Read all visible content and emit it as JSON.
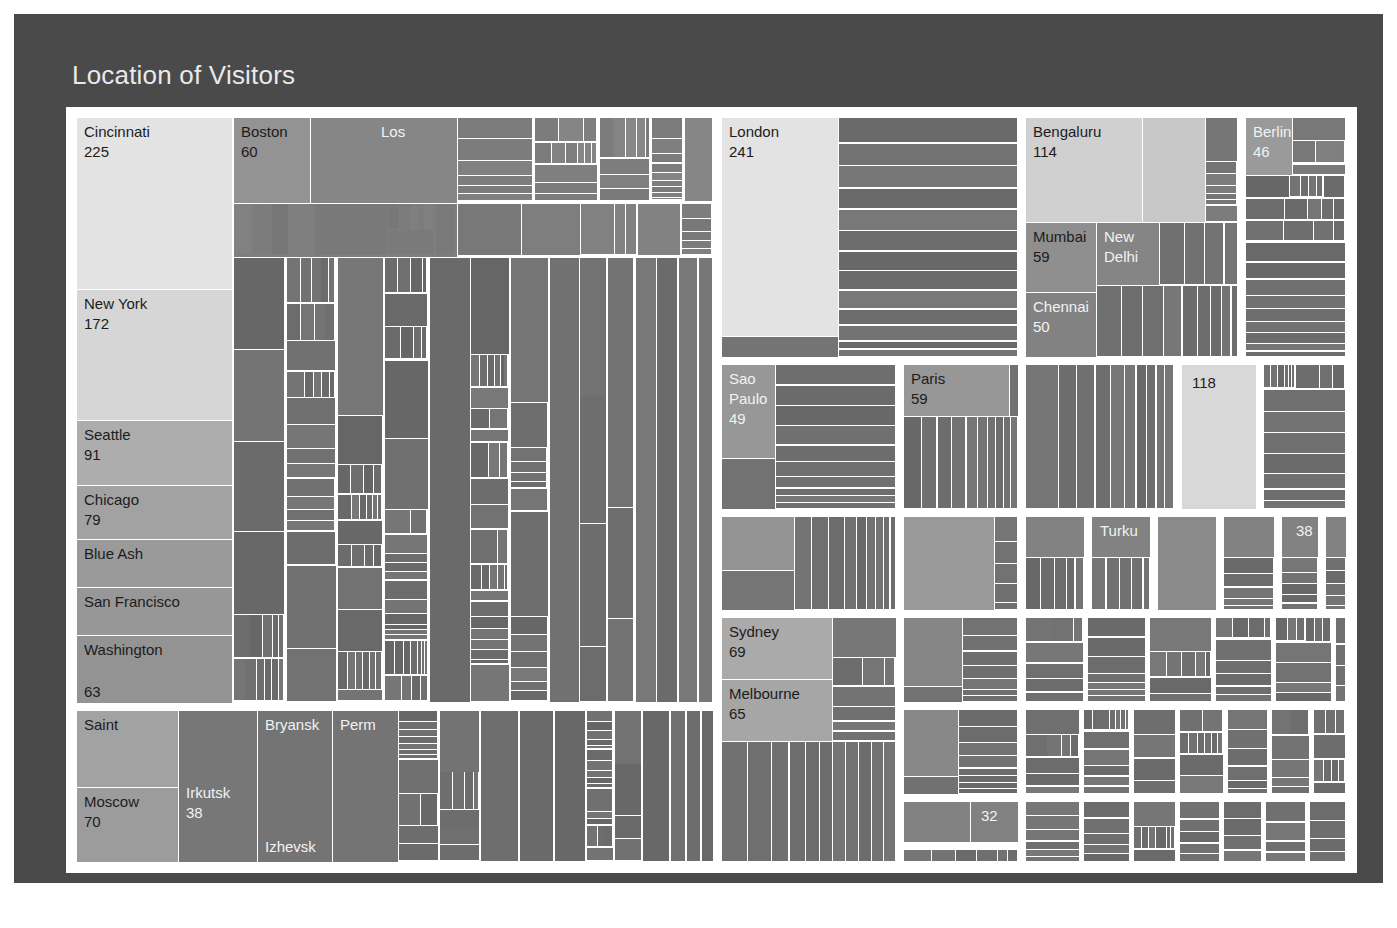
{
  "title": "Location of Visitors",
  "colors": {
    "page_background": "#ffffff",
    "panel_background": "#4a4a4a",
    "frame": "#ffffff",
    "title_text": "#e9e9e9",
    "label_dark": "#1c1c1c",
    "label_light": "#f2f2f2",
    "scale_min": "#565656",
    "scale_mid": "#8d8d8d",
    "scale_max": "#e3e6e6"
  },
  "chart_data": {
    "type": "treemap",
    "title": "Location of Visitors",
    "value_label": "Visitors",
    "grid": false,
    "legend": "none",
    "note": "Hierarchical treemap of visitor counts by city, grouped by country/region. Cell area and lightness both encode the visitor count; only the largest cells carry visible text labels.",
    "labeled_leaves": [
      {
        "name": "Cincinnati",
        "value": 225
      },
      {
        "name": "New York",
        "value": 172
      },
      {
        "name": "Seattle",
        "value": 91
      },
      {
        "name": "Chicago",
        "value": 79
      },
      {
        "name": "Blue Ash",
        "value": null
      },
      {
        "name": "San Francisco",
        "value": null
      },
      {
        "name": "Washington",
        "value": 63
      },
      {
        "name": "Boston",
        "value": 60
      },
      {
        "name": "Los",
        "value": null
      },
      {
        "name": "San",
        "value": null
      },
      {
        "name": "London",
        "value": 241
      },
      {
        "name": "Bengaluru",
        "value": 114
      },
      {
        "name": "Mumbai",
        "value": 59
      },
      {
        "name": "New Delhi",
        "value": null
      },
      {
        "name": "Chennai",
        "value": 50
      },
      {
        "name": "Berlin",
        "value": 46
      },
      {
        "name": "Sao Paulo",
        "value": 49
      },
      {
        "name": "Paris",
        "value": 59
      },
      {
        "name": "",
        "value": 118
      },
      {
        "name": "Turku",
        "value": null
      },
      {
        "name": "",
        "value": 38
      },
      {
        "name": "Sydney",
        "value": 69
      },
      {
        "name": "Melbourne",
        "value": 65
      },
      {
        "name": "",
        "value": 32
      },
      {
        "name": "Saint",
        "value": null
      },
      {
        "name": "Moscow",
        "value": 70
      },
      {
        "name": "Irkutsk",
        "value": 38
      },
      {
        "name": "Bryansk",
        "value": null
      },
      {
        "name": "Perm",
        "value": null
      },
      {
        "name": "Izhevsk",
        "value": null
      }
    ]
  },
  "labels": {
    "cincinnati": {
      "name": "Cincinnati",
      "value": "225"
    },
    "new_york": {
      "name": "New York",
      "value": "172"
    },
    "seattle": {
      "name": "Seattle",
      "value": "91"
    },
    "chicago": {
      "name": "Chicago",
      "value": "79"
    },
    "blue_ash": {
      "name": "Blue Ash",
      "value": ""
    },
    "san_francisco": {
      "name": "San Francisco",
      "value": ""
    },
    "washington": {
      "name": "Washington",
      "value": ""
    },
    "washington_val": {
      "name": "63",
      "value": ""
    },
    "boston": {
      "name": "Boston",
      "value": "60"
    },
    "los": {
      "name": "Los",
      "value": ""
    },
    "san": {
      "name": "San",
      "value": ""
    },
    "london": {
      "name": "London",
      "value": "241"
    },
    "bengaluru": {
      "name": "Bengaluru",
      "value": "114"
    },
    "mumbai": {
      "name": "Mumbai",
      "value": "59"
    },
    "new_delhi": {
      "name": "New\nDelhi",
      "value": ""
    },
    "chennai": {
      "name": "Chennai",
      "value": "50"
    },
    "berlin": {
      "name": "Berlin",
      "value": "46"
    },
    "sao_paulo": {
      "name": "Sao\nPaulo",
      "value": "49"
    },
    "paris": {
      "name": "Paris",
      "value": "59"
    },
    "n118": {
      "name": "118",
      "value": ""
    },
    "turku": {
      "name": "Turku",
      "value": ""
    },
    "n38": {
      "name": "38",
      "value": ""
    },
    "sydney": {
      "name": "Sydney",
      "value": "69"
    },
    "melbourne": {
      "name": "Melbourne",
      "value": "65"
    },
    "n32": {
      "name": "32",
      "value": ""
    },
    "saint": {
      "name": "Saint",
      "value": ""
    },
    "moscow": {
      "name": "Moscow",
      "value": "70"
    },
    "irkutsk": {
      "name": "Irkutsk",
      "value": "38"
    },
    "bryansk": {
      "name": "Bryansk",
      "value": ""
    },
    "perm": {
      "name": "Perm",
      "value": ""
    },
    "izhevsk": {
      "name": "Izhevsk",
      "value": ""
    }
  }
}
